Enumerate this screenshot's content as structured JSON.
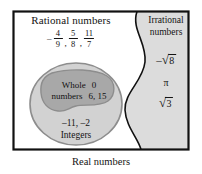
{
  "diagram": {
    "caption": "Real numbers",
    "colors": {
      "border": "#111111",
      "irrational_fill": "#dcdcdc",
      "rational_fill": "#ffffff",
      "integers_fill": "#d2d2d2",
      "whole_fill": "#a8a8a8",
      "outline": "#6b6b6b",
      "text": "#141414"
    },
    "regions": {
      "rational": {
        "heading": "Rational numbers",
        "values": [
          {
            "sign": "–",
            "numerator": "4",
            "denominator": "9"
          },
          {
            "sign": "",
            "numerator": "5",
            "denominator": "8"
          },
          {
            "sign": "",
            "numerator": "11",
            "denominator": "7"
          }
        ],
        "separator": ","
      },
      "irrational": {
        "heading": "Irrational numbers",
        "values": [
          {
            "sign": "–",
            "radical": "√",
            "radicand": "8"
          },
          {
            "symbol": "π"
          },
          {
            "sign": "",
            "radical": "√",
            "radicand": "3"
          }
        ]
      },
      "integers": {
        "label": "Integers",
        "values": "–11, –2"
      },
      "whole": {
        "label_line1_left": "Whole",
        "label_line1_right": "0",
        "label_line2_left": "numbers",
        "label_line2_right": "6, 15"
      }
    }
  }
}
